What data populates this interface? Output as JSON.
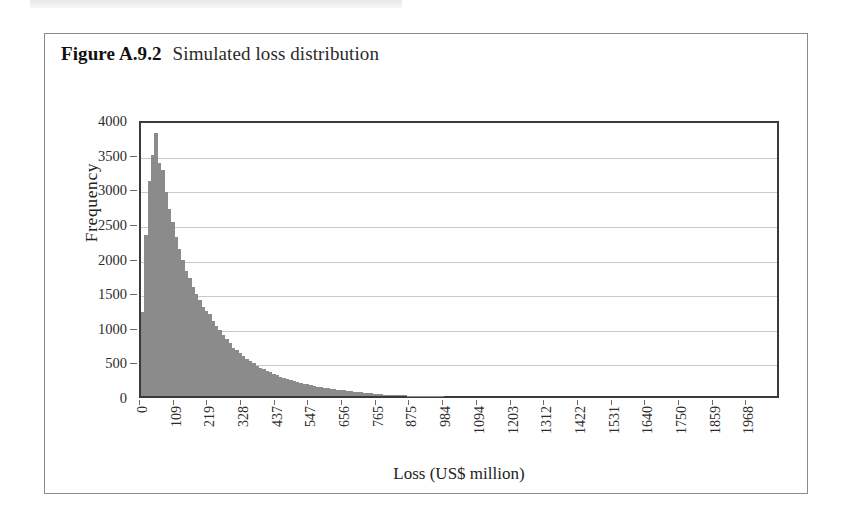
{
  "page": {
    "caption_number": "Figure A.9.2",
    "caption_text": "Simulated loss distribution",
    "bar_color": "#8b8b8b",
    "grid_color": "#c9c9c9",
    "frame_color": "#3a3a3a",
    "border_color": "#8a8a8a"
  },
  "chart_data": {
    "type": "bar",
    "title": "Simulated loss distribution",
    "xlabel": "Loss (US$ million)",
    "ylabel": "Frequency",
    "ylim": [
      0,
      4000
    ],
    "ytick_labels": [
      "0",
      "500",
      "1000",
      "1500",
      "2000",
      "2500",
      "3000",
      "3500",
      "4000"
    ],
    "ytick_values": [
      0,
      500,
      1000,
      1500,
      2000,
      2500,
      3000,
      3500,
      4000
    ],
    "grid": "horizontal",
    "legend": "none",
    "xtick_labels": [
      "0",
      "109",
      "219",
      "328",
      "437",
      "547",
      "656",
      "765",
      "875",
      "984",
      "1094",
      "1203",
      "1312",
      "1422",
      "1531",
      "1640",
      "1750",
      "1859",
      "1968"
    ],
    "xtick_values": [
      0,
      109,
      219,
      328,
      437,
      547,
      656,
      765,
      875,
      984,
      1094,
      1203,
      1312,
      1422,
      1531,
      1640,
      1750,
      1859,
      1968
    ],
    "xlim": [
      0,
      2078
    ],
    "bin_width": 10.94,
    "categories": [
      0,
      10.9,
      21.9,
      32.8,
      43.8,
      54.7,
      65.6,
      76.6,
      87.5,
      98.4,
      109.4,
      120.3,
      131.3,
      142.2,
      153.1,
      164.1,
      175,
      185.9,
      196.9,
      207.8,
      218.8,
      229.7,
      240.6,
      251.6,
      262.5,
      273.4,
      284.4,
      295.3,
      306.3,
      317.2,
      328.1,
      339.1,
      350,
      360.9,
      371.9,
      382.8,
      393.8,
      404.7,
      415.6,
      426.6,
      437.5,
      448.4,
      459.4,
      470.3,
      481.3,
      492.2,
      503.1,
      514.1,
      525,
      535.9,
      546.9,
      557.8,
      568.8,
      579.7,
      590.6,
      601.6,
      612.5,
      623.4,
      634.4,
      645.3,
      656.3,
      667.2,
      678.1,
      689.1,
      700,
      710.9,
      721.9,
      732.8,
      743.8,
      754.7,
      765.6
    ],
    "values": [
      1210,
      2320,
      3100,
      3480,
      3800,
      3370,
      3270,
      2940,
      2700,
      2520,
      2300,
      2120,
      1960,
      1810,
      1700,
      1580,
      1480,
      1380,
      1280,
      1230,
      1180,
      1090,
      1010,
      950,
      880,
      820,
      760,
      700,
      660,
      615,
      575,
      540,
      500,
      470,
      440,
      410,
      385,
      360,
      340,
      318,
      298,
      280,
      262,
      246,
      230,
      216,
      202,
      190,
      178,
      167,
      156,
      146,
      137,
      128,
      120,
      112,
      105,
      98,
      92,
      86,
      80,
      74,
      69,
      64,
      59,
      54,
      50,
      45,
      40,
      34,
      26
    ],
    "peak_value": 3800,
    "peak_x": 43.8
  }
}
